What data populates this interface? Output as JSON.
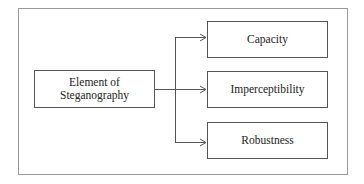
{
  "diagram": {
    "source": {
      "label_line1": "Element of",
      "label_line2": "Steganography"
    },
    "targets": [
      {
        "label": "Capacity"
      },
      {
        "label": "Imperceptibility"
      },
      {
        "label": "Robustness"
      }
    ],
    "edges": [
      {
        "from": "Element of Steganography",
        "to": "Capacity"
      },
      {
        "from": "Element of Steganography",
        "to": "Imperceptibility"
      },
      {
        "from": "Element of Steganography",
        "to": "Robustness"
      }
    ],
    "colors": {
      "frame": "#9a9a9a",
      "box_border": "#555555",
      "line": "#555555",
      "text": "#222222"
    }
  }
}
